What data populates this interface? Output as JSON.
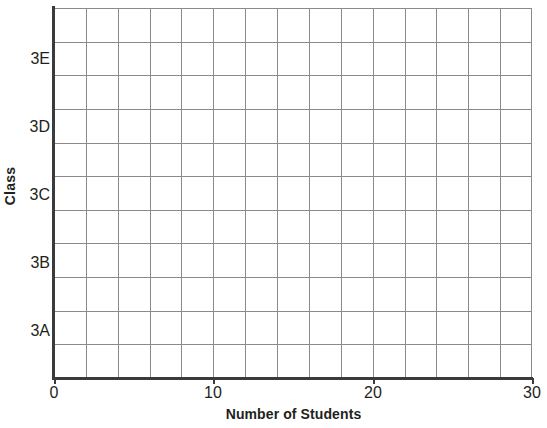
{
  "chart_data": {
    "type": "bar",
    "orientation": "horizontal",
    "title": "",
    "subtitle": "",
    "xlabel": "Number of Students",
    "ylabel": "Class",
    "categories": [
      "3A",
      "3B",
      "3C",
      "3D",
      "3E"
    ],
    "values": [
      null,
      null,
      null,
      null,
      null
    ],
    "series": [
      {
        "name": "Number of Students",
        "values": [
          null,
          null,
          null,
          null,
          null
        ]
      }
    ],
    "xlim": [
      0,
      30
    ],
    "x_tick_labels": [
      "0",
      "10",
      "20",
      "30"
    ],
    "x_tick_values": [
      0,
      10,
      20,
      30
    ],
    "x_gridline_step": 2,
    "x_gridline_count": 15,
    "y_gridline_count": 11,
    "grid": true,
    "legend": false,
    "legend_position": "none",
    "annotations": [],
    "note": "Empty plotting grid template; no bars are drawn."
  },
  "axes": {
    "y_title": "Class",
    "x_title": "Number of Students",
    "y_categories": [
      {
        "label": "3E",
        "top": 50
      },
      {
        "label": "3D",
        "top": 118
      },
      {
        "label": "3C",
        "top": 186
      },
      {
        "label": "3B",
        "top": 254
      },
      {
        "label": "3A",
        "top": 322
      }
    ],
    "x_ticks": [
      {
        "label": "0",
        "left": 54
      },
      {
        "label": "10",
        "left": 213
      },
      {
        "label": "20",
        "left": 373
      },
      {
        "label": "30",
        "left": 532
      }
    ]
  },
  "colors": {
    "background": "#ffffff",
    "grid_line": "#8a8a8a",
    "axis_line": "#3b3b3b",
    "text": "#231f20"
  }
}
